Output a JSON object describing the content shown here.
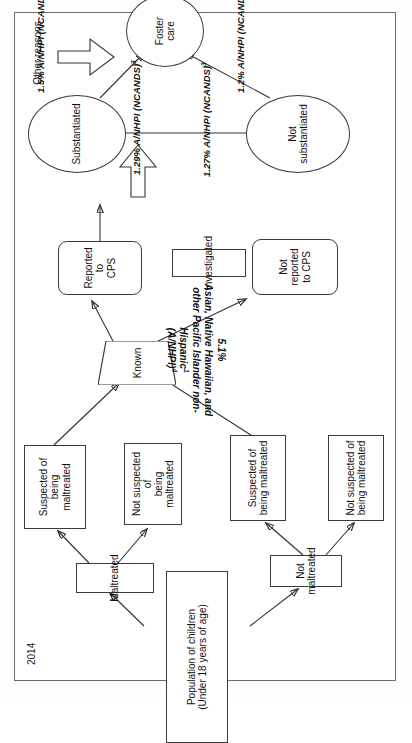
{
  "page": {
    "year_label": "2014",
    "orientation_note": "diagram rotated 90 degrees counter-clockwise on the page"
  },
  "diagram": {
    "title": "",
    "type": "flowchart",
    "nodes": [
      {
        "id": "population",
        "label": "Population of children\n(Under 18 years of age)",
        "line1": "Population of children",
        "line2": "(Under 18 years of age)",
        "shape": "rectangle"
      },
      {
        "id": "maltreated",
        "line1": "Maltreated",
        "line2": "",
        "shape": "rectangle"
      },
      {
        "id": "not-maltreated",
        "line1": "Not",
        "line2": "maltreated",
        "shape": "rectangle"
      },
      {
        "id": "suspected-left",
        "line1": "Suspected of being",
        "line2": "maltreated",
        "shape": "rectangle"
      },
      {
        "id": "not-suspected-left",
        "line1": "Not suspected of",
        "line2": "being maltreated",
        "shape": "rectangle"
      },
      {
        "id": "suspected-right",
        "line1": "Suspected of",
        "line2": "being maltreated",
        "shape": "rectangle"
      },
      {
        "id": "not-suspected-right",
        "line1": "Not suspected of",
        "line2": "being maltreated",
        "shape": "rectangle"
      },
      {
        "id": "known",
        "line1": "Known",
        "line2": "",
        "shape": "trapezoid"
      },
      {
        "id": "reported-cps",
        "line1": "Reported to",
        "line2": "CPS",
        "shape": "rounded-rectangle"
      },
      {
        "id": "not-reported-cps",
        "line1": "Not reported",
        "line2": "to CPS",
        "shape": "rounded-rectangle"
      },
      {
        "id": "investigated",
        "line1": "Investigated",
        "line2": "",
        "shape": "rectangle"
      },
      {
        "id": "substantiated",
        "line1": "Substantiated",
        "line2": "",
        "shape": "ellipse"
      },
      {
        "id": "not-substantiated",
        "line1": "Not",
        "line2": "substantiated",
        "shape": "ellipse"
      },
      {
        "id": "foster-care",
        "line1": "Foster",
        "line2": "care",
        "shape": "ellipse"
      }
    ],
    "annotations": {
      "population_stat": {
        "pct": "5.1%",
        "line1": "Asian, Native Hawaiian, and",
        "line2": "other Pacific Islander non-",
        "line3": "Hispanic",
        "sup3": "1",
        "line4": "(A/NHPI)",
        "sup4": "4"
      },
      "substantiated_stat": {
        "pct": "1.29%",
        "group": "A/NHPI",
        "source": "(NCANDS)",
        "sup": "3"
      },
      "not_substantiated_stat": {
        "pct": "1.27%",
        "group": "A/NHPI",
        "source": "(NCANDS)",
        "sup": "3"
      },
      "foster_from_substantiated": {
        "pct": "1.5%",
        "group": "A/NHPI",
        "source": "(NCANDS)",
        "sup": "3"
      },
      "foster_from_not_substantiated": {
        "pct": "1.2%",
        "group": "A/NHPI",
        "source": "(NCANDS)",
        "sup": "3"
      },
      "other_reasons": "Other reasons"
    },
    "colors": {
      "node_stroke": "#3a3a3a",
      "edge_stroke": "#333333",
      "thick_arrow_fill": "#7d7d7d",
      "page_border": "#6e6e6e",
      "text": "#111111"
    }
  }
}
